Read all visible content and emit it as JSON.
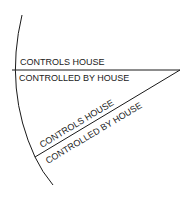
{
  "diagram": {
    "type": "house-cusp-wedge",
    "labels": {
      "upper_line_above": "CONTROLS HOUSE",
      "upper_line_below": "CONTROLLED BY HOUSE",
      "lower_line_above": "CONTROLS HOUSE",
      "lower_line_below": "CONTROLLED BY HOUSE"
    },
    "colors": {
      "ink": "#1a1a1a",
      "background": "#ffffff"
    }
  }
}
